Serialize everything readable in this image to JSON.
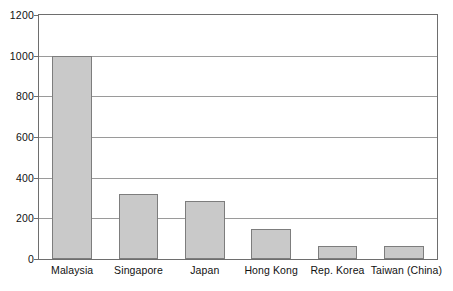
{
  "chart_data": {
    "type": "bar",
    "title": "",
    "xlabel": "",
    "ylabel": "",
    "categories": [
      "Malaysia",
      "Singapore",
      "Japan",
      "Hong Kong",
      "Rep. Korea",
      "Taiwan (China)"
    ],
    "values": [
      1000,
      320,
      285,
      150,
      62,
      62
    ],
    "ylim": [
      0,
      1200
    ],
    "yticks": [
      0,
      200,
      400,
      600,
      800,
      1000,
      1200
    ],
    "ytick_labels": [
      "0",
      "200",
      "400",
      "600",
      "800",
      "1000",
      "1200"
    ],
    "grid": true,
    "legend": null,
    "series": [
      {
        "name": "",
        "values": [
          1000,
          320,
          285,
          150,
          62,
          62
        ]
      }
    ],
    "colors": {
      "bar_fill": "#c9c9c9",
      "bar_edge": "#7d7d7d",
      "gridline": "#9a9a9a",
      "frame": "#6e6e6e",
      "text": "#111111",
      "background": "#ffffff"
    }
  }
}
